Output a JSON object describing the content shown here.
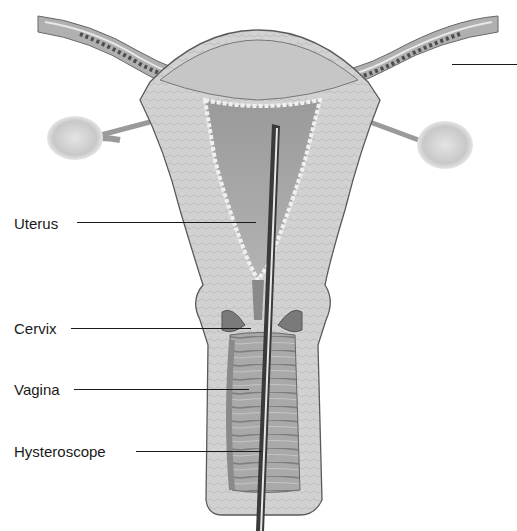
{
  "figure": {
    "colors": {
      "background": "#ffffff",
      "tissue_light": "#d4d4d4",
      "tissue_mid": "#b5b5b5",
      "cavity_dark": "#8e8e8e",
      "outline": "#5a5a5a",
      "instrument": "#3a3a3a",
      "label_text": "#1a1a1a"
    }
  },
  "labels": [
    {
      "id": "uterus",
      "text": "Uterus",
      "x": 14,
      "y": 216,
      "line_x1": 77,
      "line_x2": 256,
      "line_y": 223
    },
    {
      "id": "cervix",
      "text": "Cervix",
      "x": 14,
      "y": 321,
      "line_x1": 71,
      "line_x2": 251,
      "line_y": 328
    },
    {
      "id": "vagina",
      "text": "Vagina",
      "x": 14,
      "y": 382,
      "line_x1": 74,
      "line_x2": 249,
      "line_y": 389
    },
    {
      "id": "hysteroscope",
      "text": "Hysteroscope",
      "x": 14,
      "y": 444,
      "line_x1": 136,
      "line_x2": 262,
      "line_y": 451
    }
  ],
  "cut_off_leader": {
    "x1": 452,
    "x2": 517,
    "y": 64
  }
}
